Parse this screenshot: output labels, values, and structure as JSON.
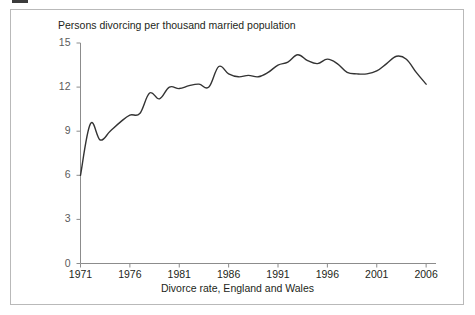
{
  "figure": {
    "frame_border_color": "#b9b9b9",
    "background": "#ffffff"
  },
  "chart_data": {
    "type": "line",
    "title": "Persons divorcing per thousand married population",
    "xlabel": "Divorce rate, England and Wales",
    "ylabel": "",
    "xlim": [
      1971,
      2007
    ],
    "ylim": [
      0,
      15
    ],
    "grid": false,
    "legend": null,
    "line_color": "#333333",
    "x_ticks": [
      "1971",
      "1976",
      "1981",
      "1986",
      "1991",
      "1996",
      "2001",
      "2006"
    ],
    "x_tick_values": [
      1971,
      1976,
      1981,
      1986,
      1991,
      1996,
      2001,
      2006
    ],
    "y_ticks": [
      "0",
      "3",
      "6",
      "9",
      "12",
      "15"
    ],
    "y_tick_values": [
      0,
      3,
      6,
      9,
      12,
      15
    ],
    "series": [
      {
        "name": "Divorce rate, England and Wales",
        "x": [
          1971,
          1972,
          1973,
          1974,
          1975,
          1976,
          1977,
          1978,
          1979,
          1980,
          1981,
          1982,
          1983,
          1984,
          1985,
          1986,
          1987,
          1988,
          1989,
          1990,
          1991,
          1992,
          1993,
          1994,
          1995,
          1996,
          1997,
          1998,
          1999,
          2000,
          2001,
          2002,
          2003,
          2004,
          2005,
          2006
        ],
        "values": [
          6.0,
          9.5,
          8.4,
          9.0,
          9.6,
          10.1,
          10.2,
          11.6,
          11.2,
          12.0,
          11.9,
          12.1,
          12.2,
          12.0,
          13.4,
          12.9,
          12.7,
          12.8,
          12.7,
          13.0,
          13.5,
          13.7,
          14.2,
          13.8,
          13.6,
          13.9,
          13.6,
          13.0,
          12.9,
          12.9,
          13.1,
          13.6,
          14.1,
          13.9,
          13.0,
          12.2
        ]
      }
    ]
  }
}
